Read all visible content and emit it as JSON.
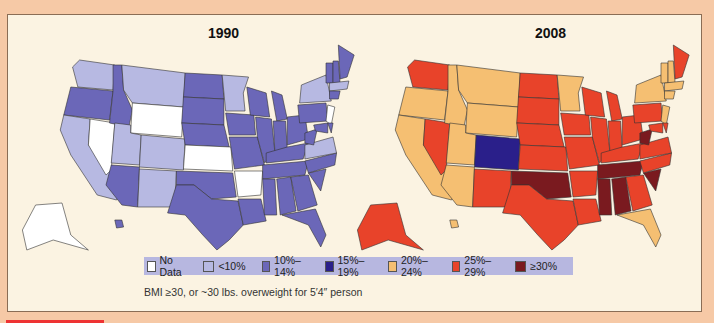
{
  "colors": {
    "no_data": "#ffffff",
    "lt10": "#b7b9e2",
    "p10_14": "#6b67b8",
    "p15_19": "#2a1f8a",
    "p20_24": "#f5bf72",
    "p25_29": "#e8432a",
    "ge30": "#7a1a1f"
  },
  "maps": [
    {
      "year": "1990",
      "title": "1990"
    },
    {
      "year": "2008",
      "title": "2008"
    }
  ],
  "legend": [
    {
      "label": "No Data",
      "color": "#ffffff"
    },
    {
      "label": "<10%",
      "color": "#b7b9e2"
    },
    {
      "label": "10%–14%",
      "color": "#6b67b8"
    },
    {
      "label": "15%–19%",
      "color": "#2a1f8a"
    },
    {
      "label": "20%–24%",
      "color": "#f5bf72"
    },
    {
      "label": "25%–29%",
      "color": "#e8432a"
    },
    {
      "label": "≥30%",
      "color": "#7a1a1f"
    }
  ],
  "caption": "BMI ≥30, or ~30 lbs. overweight for 5′4″ person",
  "chart_data": {
    "type": "choropleth",
    "maps": [
      {
        "year": "1990",
        "states": {
          "WA": "<10%",
          "OR": "10%–14%",
          "CA": "<10%",
          "NV": "No Data",
          "ID": "10%–14%",
          "MT": "<10%",
          "WY": "No Data",
          "UT": "<10%",
          "CO": "<10%",
          "AZ": "10%–14%",
          "NM": "<10%",
          "ND": "10%–14%",
          "SD": "10%–14%",
          "NE": "10%–14%",
          "KS": "No Data",
          "OK": "10%–14%",
          "TX": "10%–14%",
          "MN": "<10%",
          "IA": "10%–14%",
          "MO": "10%–14%",
          "AR": "No Data",
          "LA": "10%–14%",
          "WI": "10%–14%",
          "IL": "10%–14%",
          "MI": "10%–14%",
          "IN": "10%–14%",
          "OH": "10%–14%",
          "KY": "10%–14%",
          "TN": "10%–14%",
          "MS": "10%–14%",
          "AL": "10%–14%",
          "GA": "10%–14%",
          "FL": "10%–14%",
          "SC": "10%–14%",
          "NC": "10%–14%",
          "VA": "<10%",
          "WV": "10%–14%",
          "PA": "10%–14%",
          "NY": "<10%",
          "NJ": "No Data",
          "ME": "10%–14%",
          "VT": "10%–14%",
          "NH": "10%–14%",
          "MA": "<10%",
          "CT": "10%–14%",
          "MD": "10%–14%",
          "DE": "10%–14%",
          "AK": "No Data",
          "HI": "10%–14%"
        }
      },
      {
        "year": "2008",
        "states": {
          "WA": "25%–29%",
          "OR": "20%–24%",
          "CA": "20%–24%",
          "NV": "25%–29%",
          "ID": "20%–24%",
          "MT": "20%–24%",
          "WY": "20%–24%",
          "UT": "20%–24%",
          "CO": "15%–19%",
          "AZ": "20%–24%",
          "NM": "25%–29%",
          "ND": "25%–29%",
          "SD": "25%–29%",
          "NE": "25%–29%",
          "KS": "25%–29%",
          "OK": "≥30%",
          "TX": "25%–29%",
          "MN": "20%–24%",
          "IA": "25%–29%",
          "MO": "25%–29%",
          "AR": "25%–29%",
          "LA": "25%–29%",
          "WI": "25%–29%",
          "IL": "25%–29%",
          "MI": "25%–29%",
          "IN": "25%–29%",
          "OH": "25%–29%",
          "KY": "25%–29%",
          "TN": "≥30%",
          "MS": "≥30%",
          "AL": "≥30%",
          "GA": "25%–29%",
          "FL": "20%–24%",
          "SC": "≥30%",
          "NC": "25%–29%",
          "VA": "25%–29%",
          "WV": "≥30%",
          "PA": "25%–29%",
          "NY": "20%–24%",
          "NJ": "20%–24%",
          "ME": "25%–29%",
          "VT": "20%–24%",
          "NH": "20%–24%",
          "MA": "20%–24%",
          "CT": "20%–24%",
          "MD": "25%–29%",
          "DE": "25%–29%",
          "AK": "25%–29%",
          "HI": "20%–24%"
        }
      }
    ],
    "legend": [
      "No Data",
      "<10%",
      "10%–14%",
      "15%–19%",
      "20%–24%",
      "25%–29%",
      "≥30%"
    ],
    "annotations": [
      "BMI ≥30, or ~30 lbs. overweight for 5′4″ person"
    ]
  }
}
